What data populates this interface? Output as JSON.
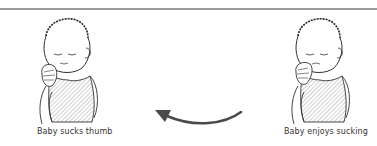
{
  "diagram": {
    "top_rule_color": "#9a9a9a",
    "arrow_color": "#4a4a4a",
    "arrow_direction": "right-to-left",
    "panels": [
      {
        "id": "left",
        "illustration": "baby-sucking-thumb",
        "caption": "Baby sucks thumb"
      },
      {
        "id": "right",
        "illustration": "baby-enjoys-sucking",
        "caption": "Baby enjoys sucking"
      }
    ]
  }
}
